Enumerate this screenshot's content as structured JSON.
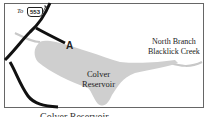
{
  "map": {
    "reservoir_label_line1": "Colver",
    "reservoir_label_line2": "Reservoir",
    "creek_label_line1": "North Branch",
    "creek_label_line2": "Blacklick Creek",
    "point_marker": "A",
    "road_direction_prefix": "To",
    "route_number": "553",
    "caption_partial": "Colver Reservoir"
  },
  "colors": {
    "reservoir_fill": "#cfcfcf",
    "creek": "#c8c8c8",
    "roads": "#111111",
    "frame": "#555555"
  }
}
